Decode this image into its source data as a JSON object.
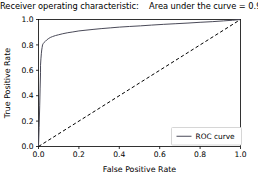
{
  "chart_data": {
    "type": "line",
    "title": "Receiver operating characteristic:    Area under the curve = 0.95",
    "title_parts": {
      "main": "Receiver operating characteristic:",
      "auc_text": "Area under the curve = 0.95",
      "auc_value": 0.95
    },
    "xlabel": "False Positive Rate",
    "ylabel": "True Positive Rate",
    "xlim": [
      0.0,
      1.0
    ],
    "ylim": [
      0.0,
      1.0
    ],
    "xticks": [
      "0.0",
      "0.2",
      "0.4",
      "0.6",
      "0.8",
      "1.0"
    ],
    "xtick_values": [
      0.0,
      0.2,
      0.4,
      0.6,
      0.8,
      1.0
    ],
    "yticks": [
      "0.0",
      "0.2",
      "0.4",
      "0.6",
      "0.8",
      "1.0"
    ],
    "ytick_values": [
      0.0,
      0.2,
      0.4,
      0.6,
      0.8,
      1.0
    ],
    "grid": false,
    "legend": {
      "position": "lower right",
      "entries": [
        {
          "label": "ROC curve",
          "style": "solid",
          "color": "#4a4a58"
        }
      ]
    },
    "series": [
      {
        "name": "ROC curve",
        "style": "solid",
        "color": "#4a4a58",
        "linewidth": 1.0,
        "x": [
          0.0,
          0.003,
          0.006,
          0.008,
          0.01,
          0.01,
          0.012,
          0.014,
          0.016,
          0.018,
          0.02,
          0.024,
          0.028,
          0.034,
          0.04,
          0.048,
          0.058,
          0.07,
          0.085,
          0.1,
          0.12,
          0.145,
          0.17,
          0.2,
          0.235,
          0.27,
          0.31,
          0.355,
          0.4,
          0.45,
          0.505,
          0.56,
          0.62,
          0.68,
          0.74,
          0.8,
          0.86,
          0.915,
          0.96,
          1.0
        ],
        "y": [
          0.0,
          0.15,
          0.32,
          0.46,
          0.58,
          0.64,
          0.69,
          0.73,
          0.76,
          0.78,
          0.8,
          0.812,
          0.82,
          0.828,
          0.838,
          0.848,
          0.858,
          0.866,
          0.874,
          0.88,
          0.888,
          0.896,
          0.902,
          0.91,
          0.916,
          0.922,
          0.928,
          0.934,
          0.94,
          0.945,
          0.95,
          0.956,
          0.962,
          0.967,
          0.972,
          0.978,
          0.983,
          0.989,
          0.994,
          1.0
        ]
      },
      {
        "name": "chance-diagonal",
        "style": "dashed",
        "color": "#000000",
        "linewidth": 1.0,
        "x": [
          0.0,
          1.0
        ],
        "y": [
          0.0,
          1.0
        ]
      }
    ]
  }
}
